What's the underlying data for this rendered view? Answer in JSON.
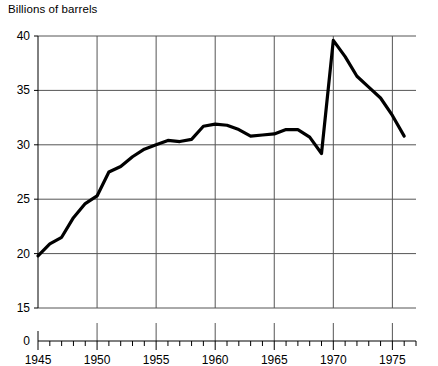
{
  "chart_data": {
    "type": "line",
    "title": "Billions of barrels",
    "xlabel": "",
    "ylabel": "Billions of barrels",
    "grid": true,
    "legend": null,
    "axis_break": true,
    "xlim": [
      1945,
      1977
    ],
    "ylim": [
      15,
      40
    ],
    "y_zero_shown": true,
    "y_ticks": [
      40,
      35,
      30,
      25,
      20,
      15,
      0
    ],
    "y_tick_labels": [
      "40",
      "35",
      "30",
      "25",
      "20",
      "15",
      "0"
    ],
    "x_ticks": [
      1945,
      1950,
      1955,
      1960,
      1965,
      1970,
      1975
    ],
    "x_tick_labels": [
      "1945",
      "1950",
      "1955",
      "1960",
      "1965",
      "1970",
      "1975"
    ],
    "x_minor_tick_step": 1,
    "series": [
      {
        "name": "Proved crude oil reserves",
        "color": "#000000",
        "x": [
          1945,
          1946,
          1947,
          1948,
          1949,
          1950,
          1951,
          1952,
          1953,
          1954,
          1955,
          1956,
          1957,
          1958,
          1959,
          1960,
          1961,
          1962,
          1963,
          1964,
          1965,
          1966,
          1967,
          1968,
          1969,
          1970,
          1971,
          1972,
          1973,
          1974,
          1975,
          1976
        ],
        "values": [
          19.8,
          20.9,
          21.5,
          23.3,
          24.6,
          25.3,
          27.5,
          28.0,
          28.9,
          29.6,
          30.0,
          30.4,
          30.3,
          30.5,
          31.7,
          31.9,
          31.8,
          31.4,
          30.8,
          30.9,
          31.0,
          31.4,
          31.4,
          30.7,
          29.2,
          39.6,
          38.1,
          36.3,
          35.3,
          34.3,
          32.7,
          30.8
        ]
      }
    ]
  },
  "labels": {
    "axis_title": "Billions of barrels"
  }
}
